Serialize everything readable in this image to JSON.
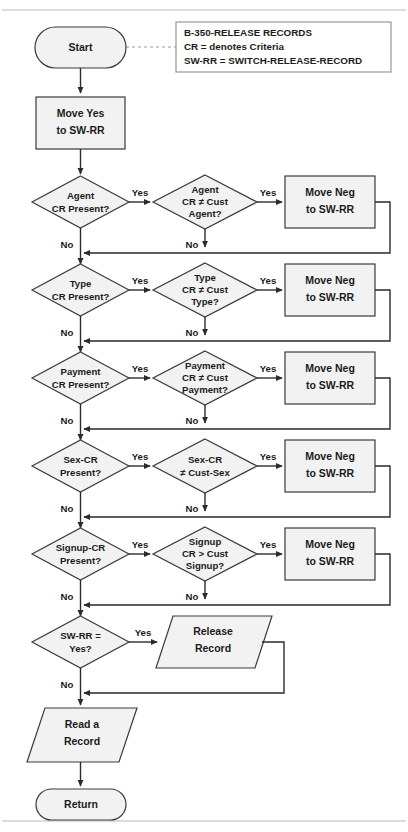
{
  "diagram": {
    "colors": {
      "shape_fill": "#f2f2f2",
      "shape_stroke": "#3a3a3a",
      "connector": "#2b2b2b",
      "rule": "#b9b9b9",
      "text": "#1b1b1b"
    }
  },
  "legend": {
    "line1": "B-350-RELEASE RECORDS",
    "line2": "CR = denotes Criteria",
    "line3": "SW-RR = SWITCH-RELEASE-RECORD"
  },
  "nodes": {
    "start": {
      "label": "Start",
      "shape": "terminator"
    },
    "move_yes": {
      "line1": "Move Yes",
      "line2": "to SW-RR",
      "shape": "process"
    },
    "sw_rr_check": {
      "line1": "SW-RR =",
      "line2": "Yes?",
      "shape": "decision"
    },
    "release_record": {
      "line1": "Release",
      "line2": "Record",
      "shape": "io"
    },
    "read_record": {
      "line1": "Read a",
      "line2": "Record",
      "shape": "io"
    },
    "return": {
      "label": "Return",
      "shape": "terminator"
    }
  },
  "rows": [
    {
      "id": "agent",
      "left": {
        "line1": "Agent",
        "line2": "CR Present?",
        "line3": ""
      },
      "mid": {
        "line1": "Agent",
        "line2": "CR ≠ Cust",
        "line3": "Agent?"
      },
      "right": {
        "line1": "Move Neg",
        "line2": "to SW-RR"
      },
      "left_yes": "Yes",
      "left_no": "No",
      "mid_yes": "Yes",
      "mid_no": "No"
    },
    {
      "id": "type",
      "left": {
        "line1": "Type",
        "line2": "CR Present?",
        "line3": ""
      },
      "mid": {
        "line1": "Type",
        "line2": "CR ≠ Cust",
        "line3": "Type?"
      },
      "right": {
        "line1": "Move Neg",
        "line2": "to SW-RR"
      },
      "left_yes": "Yes",
      "left_no": "No",
      "mid_yes": "Yes",
      "mid_no": "No"
    },
    {
      "id": "payment",
      "left": {
        "line1": "Payment",
        "line2": "CR Present?",
        "line3": ""
      },
      "mid": {
        "line1": "Payment",
        "line2": "CR ≠ Cust",
        "line3": "Payment?"
      },
      "right": {
        "line1": "Move Neg",
        "line2": "to SW-RR"
      },
      "left_yes": "Yes",
      "left_no": "No",
      "mid_yes": "Yes",
      "mid_no": "No"
    },
    {
      "id": "sex",
      "left": {
        "line1": "Sex-CR",
        "line2": "Present?",
        "line3": ""
      },
      "mid": {
        "line1": "Sex-CR",
        "line2": "≠ Cust-Sex",
        "line3": ""
      },
      "right": {
        "line1": "Move Neg",
        "line2": "to SW-RR"
      },
      "left_yes": "Yes",
      "left_no": "No",
      "mid_yes": "Yes",
      "mid_no": "No"
    },
    {
      "id": "signup",
      "left": {
        "line1": "Signup-CR",
        "line2": "Present?",
        "line3": ""
      },
      "mid": {
        "line1": "Signup",
        "line2": "CR > Cust",
        "line3": "Signup?"
      },
      "right": {
        "line1": "Move Neg",
        "line2": "to SW-RR"
      },
      "left_yes": "Yes",
      "left_no": "No",
      "mid_yes": "Yes",
      "mid_no": "No"
    }
  ],
  "final_row": {
    "yes_label": "Yes",
    "no_label": "No"
  }
}
